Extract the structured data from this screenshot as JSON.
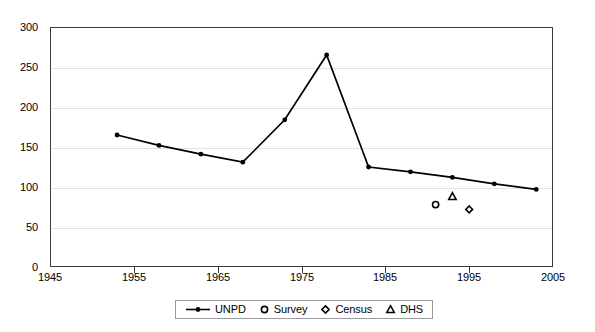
{
  "chart_data": {
    "type": "line",
    "title": "",
    "xlabel": "",
    "ylabel": "",
    "xlim": [
      1945,
      2005
    ],
    "ylim": [
      0,
      300
    ],
    "xticks": [
      1945,
      1955,
      1965,
      1975,
      1985,
      1995,
      2005
    ],
    "yticks": [
      0,
      50,
      100,
      150,
      200,
      250,
      300
    ],
    "grid": "horizontal",
    "legend_position": "bottom",
    "series": [
      {
        "name": "UNPD",
        "type": "line",
        "marker": "dot",
        "x": [
          1953,
          1958,
          1963,
          1968,
          1973,
          1978,
          1983,
          1988,
          1993,
          1998,
          2003
        ],
        "values": [
          165,
          152,
          141,
          131,
          184,
          265,
          125,
          119,
          112,
          104,
          97
        ]
      },
      {
        "name": "Survey",
        "type": "scatter",
        "marker": "circle",
        "x": [
          1991
        ],
        "values": [
          78
        ]
      },
      {
        "name": "Census",
        "type": "scatter",
        "marker": "diamond",
        "x": [
          1995
        ],
        "values": [
          72
        ]
      },
      {
        "name": "DHS",
        "type": "scatter",
        "marker": "triangle",
        "x": [
          1993
        ],
        "values": [
          88
        ]
      }
    ]
  },
  "axes": {
    "y_labels": [
      "300",
      "250",
      "200",
      "150",
      "100",
      "50",
      "0"
    ],
    "x_labels": [
      "1945",
      "1955",
      "1965",
      "1975",
      "1985",
      "1995",
      "2005"
    ]
  },
  "legend": {
    "items": [
      {
        "label": "UNPD",
        "marker": "line-dot-marker"
      },
      {
        "label": "Survey",
        "marker": "circle-marker"
      },
      {
        "label": "Census",
        "marker": "diamond-marker"
      },
      {
        "label": "DHS",
        "marker": "triangle-marker"
      }
    ]
  },
  "colors": {
    "series": "#000000",
    "axis": "#3a3a3a",
    "grid": "#e2e2e2",
    "background": "#ffffff"
  }
}
